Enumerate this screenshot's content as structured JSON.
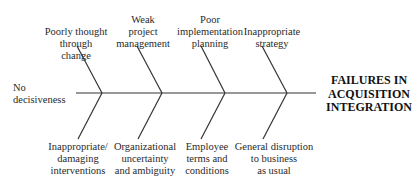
{
  "effect": "FAILURES IN\nACQUISITION\nINTEGRATION",
  "spine_cause": "No\ndecisiveness",
  "top_causes": [
    "Poorly thought\nthrough change",
    "Weak\nproject\nmanagement",
    "Poor\nimplementation\nplanning",
    "Inappropriate\nstrategy"
  ],
  "bottom_causes": [
    "Inappropriate/\ndamaging\ninterventions",
    "Organizational\nuncertainty\nand ambiguity",
    "Employee\nterms and\nconditions",
    "General disruption\nto business\nas usual"
  ]
}
